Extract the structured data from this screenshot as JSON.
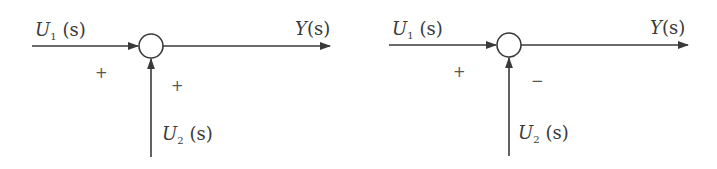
{
  "diagrams": [
    {
      "id": "left",
      "input1": {
        "var": "U",
        "sub": "1",
        "arg": "(s)"
      },
      "input2": {
        "var": "U",
        "sub": "2",
        "arg": "(s)"
      },
      "output": {
        "var": "Y",
        "arg": "(s)"
      },
      "sign_input1": "+",
      "sign_input2": "+"
    },
    {
      "id": "right",
      "input1": {
        "var": "U",
        "sub": "1",
        "arg": "(s)"
      },
      "input2": {
        "var": "U",
        "sub": "2",
        "arg": "(s)"
      },
      "output": {
        "var": "Y",
        "arg": "(s)"
      },
      "sign_input1": "+",
      "sign_input2": "−"
    }
  ],
  "colors": {
    "line": "#3a3a3a",
    "text": "#3a3a3a",
    "background": "#ffffff"
  }
}
